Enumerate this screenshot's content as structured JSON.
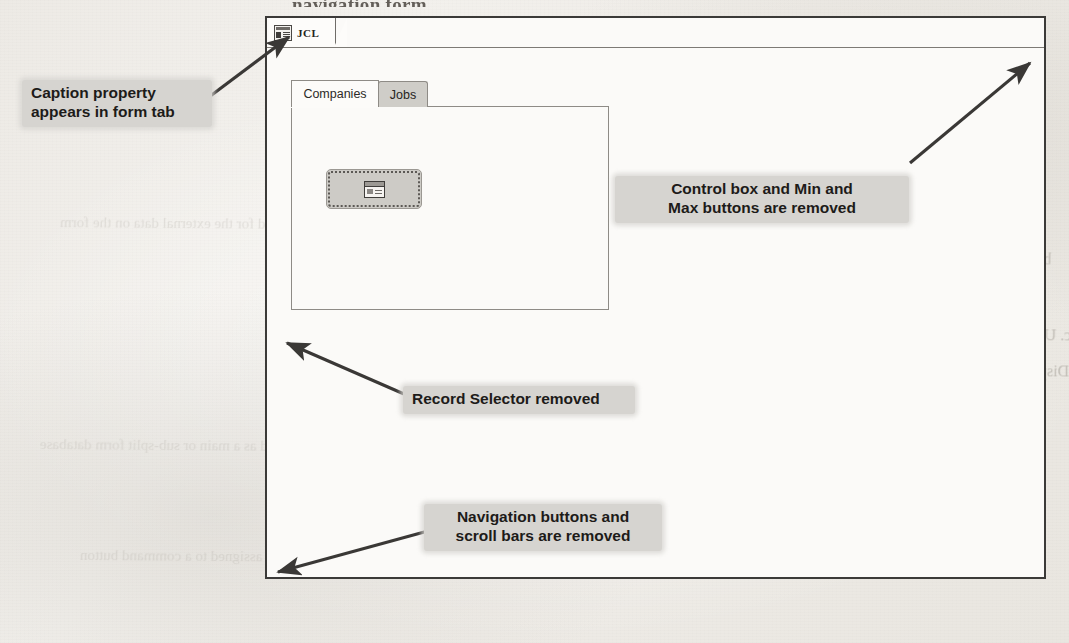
{
  "page": {
    "top_cut_heading": "navigation form",
    "paper_color": "#efece7",
    "ink_color": "#2b2926"
  },
  "form_window": {
    "document_tab": {
      "label": "JCL",
      "icon": "form-datasheet-icon"
    },
    "tab_control": {
      "tabs": [
        {
          "label": "Companies",
          "state": "active"
        },
        {
          "label": "Jobs",
          "state": "inactive"
        }
      ]
    },
    "command_button": {
      "icon": "form-button-icon",
      "state": "selected",
      "label": ""
    }
  },
  "callouts": [
    {
      "id": "caption-property",
      "text": "Caption property\nappears in form tab",
      "align": "left"
    },
    {
      "id": "control-box-min-max",
      "text": "Control box and Min and\nMax buttons are removed",
      "align": "center"
    },
    {
      "id": "record-selector",
      "text": "Record Selector removed",
      "align": "left"
    },
    {
      "id": "navigation-buttons",
      "text": "Navigation buttons and\nscroll bars are removed",
      "align": "center"
    }
  ],
  "bleed_text": {
    "lines": [
      "on the ___ tab, in the ___ group, click",
      "a. Used for the external data on the form",
      "b. Opens a single pane form for each record in the sub-datasheet",
      "or datasheet",
      "c. Used to display or apply a custom value within a certain group",
      "d. Displays a single record and a sub-report beside it in upper pane and a",
      "lower form",
      "e. Used as a main or sub-split form database",
      "f. A form with a basic form",
      "g. Questions and answers in the text FAQs NOT",
      "h. Can key can be assigned to a command button",
      "i. the way that the navigation buttons work at the screen view"
    ]
  }
}
